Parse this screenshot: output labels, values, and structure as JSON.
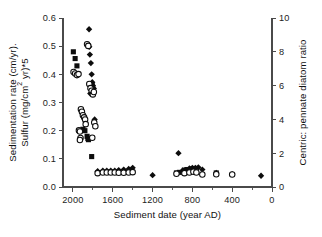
{
  "figure": {
    "background_color": "#ffffff",
    "marker_color": "#0d0d0d",
    "axis_color": "#4a4a4a"
  },
  "chart_data": {
    "type": "scatter",
    "title": "",
    "xlabel": "Sediment date (year AD)",
    "ylabel": "Sedimentation rate (cm/yr).\nSulfur (mg/cm2 yr)*5",
    "ylabel_line1": "Sedimentation rate (cm/yr).",
    "ylabel_line2_pre": "Sulfur (mg/cm",
    "ylabel_line2_sup": "2",
    "ylabel_line2_post": " yr)*5",
    "y2label": "Centric: pennate diatom ratio",
    "xlim": [
      2100,
      0
    ],
    "x_reversed": true,
    "ylim": [
      0.0,
      0.6
    ],
    "y2lim": [
      0,
      10
    ],
    "grid": false,
    "legend": null,
    "xticks": [
      2000,
      1600,
      1200,
      800,
      400,
      0
    ],
    "xticklabels": [
      "2000",
      "1600",
      "1200",
      "800",
      "400",
      "0"
    ],
    "x_minor_ticks": [
      1800,
      1400,
      1000,
      600,
      200
    ],
    "yticks": [
      0.0,
      0.1,
      0.2,
      0.3,
      0.4,
      0.5,
      0.6
    ],
    "yticklabels": [
      "0.0",
      "0.1",
      "0.2",
      "0.3",
      "0.4",
      "0.5",
      "0.6"
    ],
    "y2ticks": [
      0,
      2,
      4,
      6,
      8,
      10
    ],
    "y2ticklabels": [
      "0",
      "2",
      "4",
      "6",
      "8",
      "10"
    ],
    "series": [
      {
        "name": "Sedimentation rate",
        "marker": "diamond",
        "filled": true,
        "axis": "left",
        "points": [
          [
            1838,
            0.56
          ],
          [
            1848,
            0.505
          ],
          [
            1836,
            0.498
          ],
          [
            1830,
            0.47
          ],
          [
            1820,
            0.44
          ],
          [
            1812,
            0.4
          ],
          [
            1806,
            0.372
          ],
          [
            1800,
            0.36
          ],
          [
            1812,
            0.345
          ],
          [
            1826,
            0.332
          ],
          [
            1790,
            0.35
          ],
          [
            1782,
            0.24
          ],
          [
            1752,
            0.056
          ],
          [
            1700,
            0.058
          ],
          [
            1660,
            0.058
          ],
          [
            1620,
            0.058
          ],
          [
            1580,
            0.058
          ],
          [
            1540,
            0.06
          ],
          [
            1490,
            0.062
          ],
          [
            1440,
            0.064
          ],
          [
            1400,
            0.068
          ],
          [
            1200,
            0.042
          ],
          [
            940,
            0.12
          ],
          [
            900,
            0.058
          ],
          [
            860,
            0.06
          ],
          [
            830,
            0.066
          ],
          [
            800,
            0.068
          ],
          [
            770,
            0.068
          ],
          [
            740,
            0.07
          ],
          [
            700,
            0.062
          ],
          [
            560,
            0.05
          ],
          [
            400,
            0.046
          ],
          [
            110,
            0.04
          ]
        ]
      },
      {
        "name": "Sulfur",
        "marker": "square",
        "filled": true,
        "axis": "left",
        "points": [
          [
            1996,
            0.48
          ],
          [
            1978,
            0.456
          ],
          [
            1960,
            0.43
          ],
          [
            1806,
            0.362
          ],
          [
            1800,
            0.352
          ],
          [
            1900,
            0.205
          ],
          [
            1880,
            0.2
          ],
          [
            1858,
            0.18
          ],
          [
            1850,
            0.172
          ],
          [
            1844,
            0.168
          ],
          [
            1812,
            0.108
          ],
          [
            1640,
            0.052
          ],
          [
            1600,
            0.052
          ],
          [
            960,
            0.05
          ],
          [
            930,
            0.052
          ],
          [
            880,
            0.06
          ],
          [
            855,
            0.062
          ],
          [
            830,
            0.062
          ],
          [
            805,
            0.064
          ],
          [
            775,
            0.064
          ],
          [
            560,
            0.05
          ]
        ]
      },
      {
        "name": "Centric: pennate diatom ratio",
        "marker": "circle",
        "filled": false,
        "axis": "right",
        "points": [
          [
            1858,
            8.45
          ],
          [
            1846,
            8.35
          ],
          [
            1994,
            6.8
          ],
          [
            1978,
            6.72
          ],
          [
            1960,
            6.62
          ],
          [
            1944,
            6.68
          ],
          [
            1836,
            6.1
          ],
          [
            1824,
            5.85
          ],
          [
            1812,
            5.7
          ],
          [
            1800,
            5.48
          ],
          [
            1790,
            5.62
          ],
          [
            1920,
            4.6
          ],
          [
            1910,
            4.45
          ],
          [
            1900,
            4.25
          ],
          [
            1888,
            4.12
          ],
          [
            1878,
            4.0
          ],
          [
            1872,
            3.72
          ],
          [
            1786,
            3.82
          ],
          [
            1775,
            3.6
          ],
          [
            1940,
            3.35
          ],
          [
            1930,
            3.28
          ],
          [
            1924,
            2.9
          ],
          [
            1806,
            2.92
          ],
          [
            1930,
            2.78
          ],
          [
            1752,
            0.82
          ],
          [
            1700,
            0.86
          ],
          [
            1660,
            0.86
          ],
          [
            1620,
            0.86
          ],
          [
            1580,
            0.86
          ],
          [
            1540,
            0.84
          ],
          [
            1490,
            0.84
          ],
          [
            1440,
            0.86
          ],
          [
            1400,
            0.88
          ],
          [
            960,
            0.78
          ],
          [
            880,
            0.82
          ],
          [
            830,
            0.86
          ],
          [
            790,
            0.9
          ],
          [
            760,
            0.86
          ],
          [
            700,
            0.74
          ],
          [
            560,
            0.76
          ],
          [
            400,
            0.74
          ]
        ]
      }
    ]
  }
}
